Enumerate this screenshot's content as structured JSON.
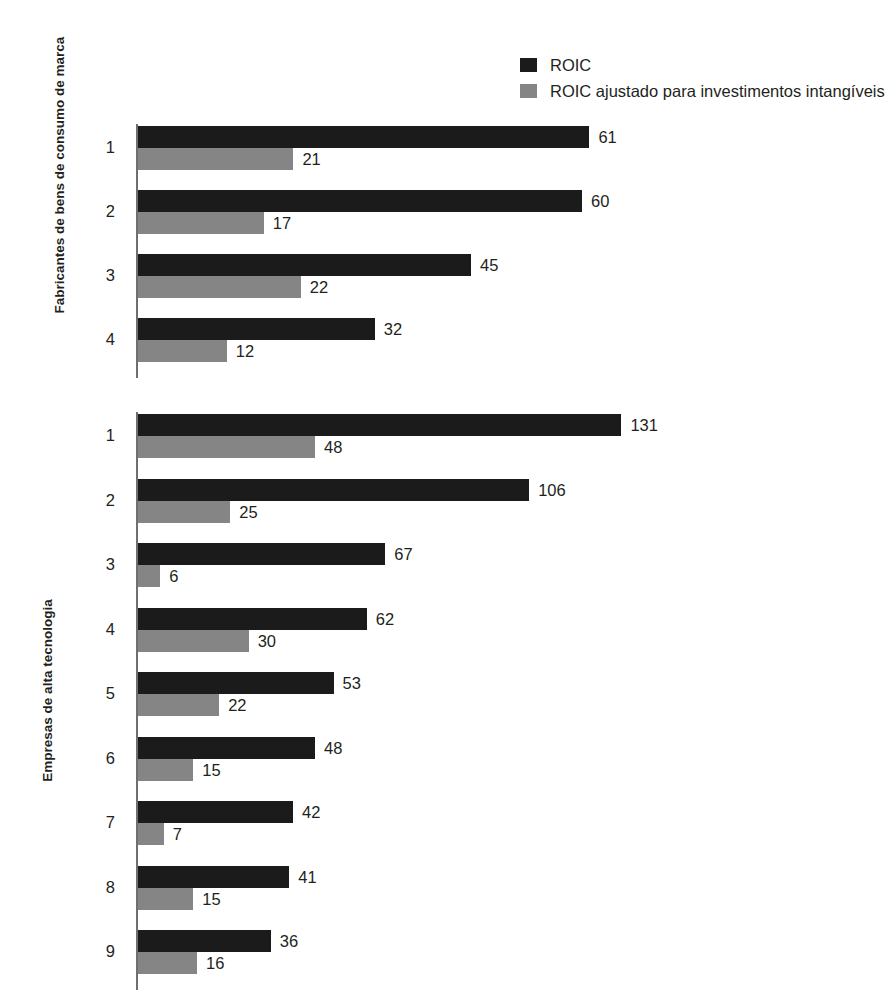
{
  "legend": {
    "items": [
      {
        "label": "ROIC",
        "color": "#1c1b1b",
        "key": "roic"
      },
      {
        "label": "ROIC ajustado para investimentos intangíveis",
        "color": "#858585",
        "key": "roic_adjusted"
      }
    ]
  },
  "charts": [
    {
      "id": "brand",
      "axis_title": "Fabricantes de bens de consumo de marca",
      "categories": [
        "1",
        "2",
        "3",
        "4"
      ],
      "rows": [
        {
          "label": "1",
          "roic": "61",
          "roic_adjusted": "21"
        },
        {
          "label": "2",
          "roic": "60",
          "roic_adjusted": "17"
        },
        {
          "label": "3",
          "roic": "45",
          "roic_adjusted": "22"
        },
        {
          "label": "4",
          "roic": "32",
          "roic_adjusted": "12"
        }
      ]
    },
    {
      "id": "tech",
      "axis_title": "Empresas de alta tecnologia",
      "categories": [
        "1",
        "2",
        "3",
        "4",
        "5",
        "6",
        "7",
        "8",
        "9"
      ],
      "rows": [
        {
          "label": "1",
          "roic": "131",
          "roic_adjusted": "48"
        },
        {
          "label": "2",
          "roic": "106",
          "roic_adjusted": "25"
        },
        {
          "label": "3",
          "roic": "67",
          "roic_adjusted": "6"
        },
        {
          "label": "4",
          "roic": "62",
          "roic_adjusted": "30"
        },
        {
          "label": "5",
          "roic": "53",
          "roic_adjusted": "22"
        },
        {
          "label": "6",
          "roic": "48",
          "roic_adjusted": "15"
        },
        {
          "label": "7",
          "roic": "42",
          "roic_adjusted": "7"
        },
        {
          "label": "8",
          "roic": "41",
          "roic_adjusted": "15"
        },
        {
          "label": "9",
          "roic": "36",
          "roic_adjusted": "16"
        }
      ]
    }
  ],
  "chart_data": [
    {
      "type": "bar",
      "orientation": "horizontal",
      "title": "Fabricantes de bens de consumo de marca",
      "xlabel": "",
      "ylabel": "Fabricantes de bens de consumo de marca",
      "categories": [
        "1",
        "2",
        "3",
        "4"
      ],
      "series": [
        {
          "name": "ROIC",
          "values": [
            61,
            60,
            45,
            32
          ],
          "color": "#1c1b1b"
        },
        {
          "name": "ROIC ajustado para investimentos intangíveis",
          "values": [
            21,
            17,
            22,
            12
          ],
          "color": "#858585"
        }
      ],
      "xlim": [
        0,
        61
      ],
      "grid": false,
      "legend_position": "top-right",
      "px_per_unit": 7.4
    },
    {
      "type": "bar",
      "orientation": "horizontal",
      "title": "Empresas de alta tecnologia",
      "xlabel": "",
      "ylabel": "Empresas de alta tecnologia",
      "categories": [
        "1",
        "2",
        "3",
        "4",
        "5",
        "6",
        "7",
        "8",
        "9"
      ],
      "series": [
        {
          "name": "ROIC",
          "values": [
            131,
            106,
            67,
            62,
            53,
            48,
            42,
            41,
            36
          ],
          "color": "#1c1b1b"
        },
        {
          "name": "ROIC ajustado para investimentos intangíveis",
          "values": [
            48,
            25,
            6,
            30,
            22,
            15,
            7,
            15,
            16
          ],
          "color": "#858585"
        }
      ],
      "xlim": [
        0,
        131
      ],
      "grid": false,
      "legend_position": "top-right",
      "px_per_unit": 3.69
    }
  ]
}
